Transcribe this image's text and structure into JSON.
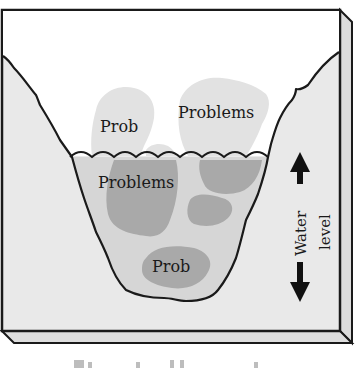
{
  "figure": {
    "type": "diagram",
    "labels_above_water": [
      {
        "id": "prob-top-left",
        "text": "Prob"
      },
      {
        "id": "problems-top-right",
        "text": "Problems"
      }
    ],
    "labels_below_water": [
      {
        "id": "problems-mid-left",
        "text": "Problems"
      },
      {
        "id": "prob-bottom",
        "text": "Prob"
      }
    ],
    "side_indicator": {
      "line1": "Water",
      "line2": "level",
      "arrow": "double-headed vertical arrow (up/down)"
    },
    "caption_cut_off": true
  },
  "colors": {
    "frame_face": "#e9e9e9",
    "sky": "#ffffff",
    "water": "#d6d6d6",
    "rock_above": "#e2e2e2",
    "rock_below": "#a9a9a9",
    "outline": "#1a1a1a",
    "arrow": "#111111"
  }
}
